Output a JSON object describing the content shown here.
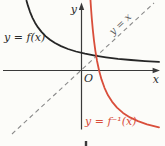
{
  "figure": {
    "background_color": "#fcfcf9",
    "axes": {
      "x_label": "x",
      "y_label": "y",
      "origin_label": "O",
      "color": "#3a3a3a"
    },
    "curves": {
      "f": {
        "label": "y = f(x)",
        "color": "#262626",
        "points": [
          [
            26.5,
            0.7
          ],
          [
            28,
            5.9
          ],
          [
            30,
            11.8
          ],
          [
            32.5,
            17.8
          ],
          [
            35,
            22.7
          ],
          [
            38,
            27.4
          ],
          [
            41.5,
            31.9
          ],
          [
            45.5,
            36.1
          ],
          [
            50,
            39.7
          ],
          [
            55,
            43.0
          ],
          [
            61,
            46.1
          ],
          [
            68,
            49.0
          ],
          [
            76,
            51.5
          ],
          [
            85,
            53.7
          ],
          [
            95,
            55.7
          ],
          [
            106,
            57.3
          ],
          [
            118,
            58.8
          ],
          [
            131,
            60.0
          ],
          [
            145,
            61.1
          ],
          [
            159,
            61.9
          ]
        ]
      },
      "f_inverse": {
        "label": "y = f⁻¹(x)",
        "color": "#d94e3b",
        "points": [
          [
            90.4,
            -1.2
          ],
          [
            91,
            8.0
          ],
          [
            91.8,
            18.6
          ],
          [
            92.8,
            29.7
          ],
          [
            94,
            40.6
          ],
          [
            95.4,
            51.1
          ],
          [
            97,
            60.7
          ],
          [
            99,
            70.2
          ],
          [
            101.5,
            79.4
          ],
          [
            104.5,
            87.8
          ],
          [
            108,
            95.3
          ],
          [
            112,
            101.6
          ],
          [
            117,
            107.6
          ],
          [
            123,
            112.9
          ],
          [
            130,
            117.4
          ],
          [
            138,
            121.1
          ],
          [
            147,
            124.3
          ],
          [
            159,
            127.3
          ]
        ]
      },
      "identity": {
        "label": "y = x",
        "color": "#8b8b8b",
        "style": "dashed",
        "points": [
          [
            12,
            134
          ],
          [
            154,
            3
          ]
        ]
      }
    }
  }
}
